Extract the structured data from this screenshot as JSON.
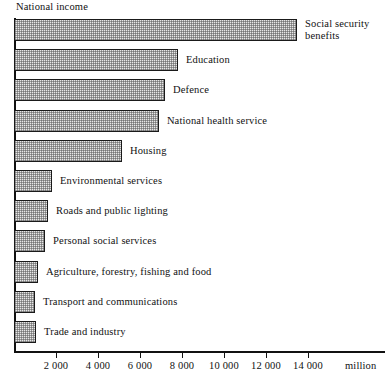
{
  "chart_data": {
    "type": "bar",
    "orientation": "horizontal",
    "title": "",
    "axis_caption": "National income",
    "xlabel": "million",
    "ylabel": "",
    "xlim": [
      0,
      17667
    ],
    "grid": false,
    "legend": "none",
    "tick_values": [
      2000,
      4000,
      6000,
      8000,
      10000,
      12000,
      14000
    ],
    "tick_labels": [
      "2 000",
      "4 000",
      "6 000",
      "8 000",
      "10 000",
      "12 000",
      "14 000"
    ],
    "categories": [
      "Social security benefits",
      "Education",
      "Defence",
      "National health service",
      "Housing",
      "Environmental services",
      "Roads and public lighting",
      "Personal social services",
      "Agriculture, forestry, fishing and food",
      "Transport and communications",
      "Trade and industry"
    ],
    "values": [
      13480,
      7810,
      7190,
      6900,
      5140,
      1810,
      1620,
      1480,
      1140,
      1000,
      1050
    ],
    "bars": [
      {
        "label": "Social security benefits",
        "label_lines": [
          "Social security",
          "benefits"
        ],
        "value": 13480
      },
      {
        "label": "Education",
        "label_lines": [
          "Education"
        ],
        "value": 7810
      },
      {
        "label": "Defence",
        "label_lines": [
          "Defence"
        ],
        "value": 7190
      },
      {
        "label": "National health service",
        "label_lines": [
          "National health service"
        ],
        "value": 6900
      },
      {
        "label": "Housing",
        "label_lines": [
          "Housing"
        ],
        "value": 5140
      },
      {
        "label": "Environmental services",
        "label_lines": [
          "Environmental services"
        ],
        "value": 1810
      },
      {
        "label": "Roads and public lighting",
        "label_lines": [
          "Roads and public lighting"
        ],
        "value": 1620
      },
      {
        "label": "Personal social services",
        "label_lines": [
          "Personal social services"
        ],
        "value": 1480
      },
      {
        "label": "Agriculture, forestry, fishing and food",
        "label_lines": [
          "Agriculture, forestry, fishing and food"
        ],
        "value": 1140
      },
      {
        "label": "Transport and communications",
        "label_lines": [
          "Transport and communications"
        ],
        "value": 1000
      },
      {
        "label": "Trade and industry",
        "label_lines": [
          "Trade and industry"
        ],
        "value": 1050
      }
    ],
    "colors": {
      "bar_fill": "#e8e8e8",
      "bar_border": "#1a1a1a",
      "axis": "#111111",
      "text": "#111111",
      "background": "#ffffff"
    }
  }
}
